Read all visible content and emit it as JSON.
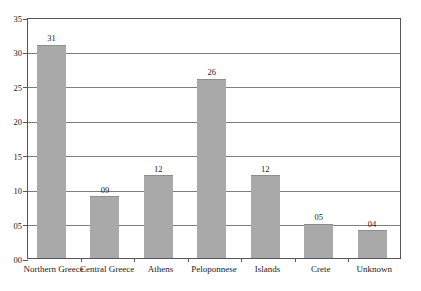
{
  "chart_data": {
    "type": "bar",
    "title": "",
    "subtitle": "",
    "xlabel": "",
    "ylabel": "",
    "categories": [
      "Northern Greece",
      "Central Greece",
      "Athens",
      "Peloponnese",
      "Islands",
      "Crete",
      "Unknown"
    ],
    "values": [
      31,
      9,
      12,
      26,
      12,
      5,
      4
    ],
    "value_labels": [
      "31",
      "09",
      "12",
      "26",
      "12",
      "05",
      "04"
    ],
    "ylim": [
      0,
      35
    ],
    "ytick_values": [
      0,
      5,
      10,
      15,
      20,
      25,
      30,
      35
    ],
    "ytick_labels": [
      "00",
      "05",
      "10",
      "15",
      "20",
      "25",
      "30",
      "35"
    ],
    "grid": true,
    "legend": "none",
    "bar_color": "#a9a9a9",
    "grid_color": "#7d7e82",
    "axis_color": "#55565a",
    "background_color": "#ffffff"
  }
}
